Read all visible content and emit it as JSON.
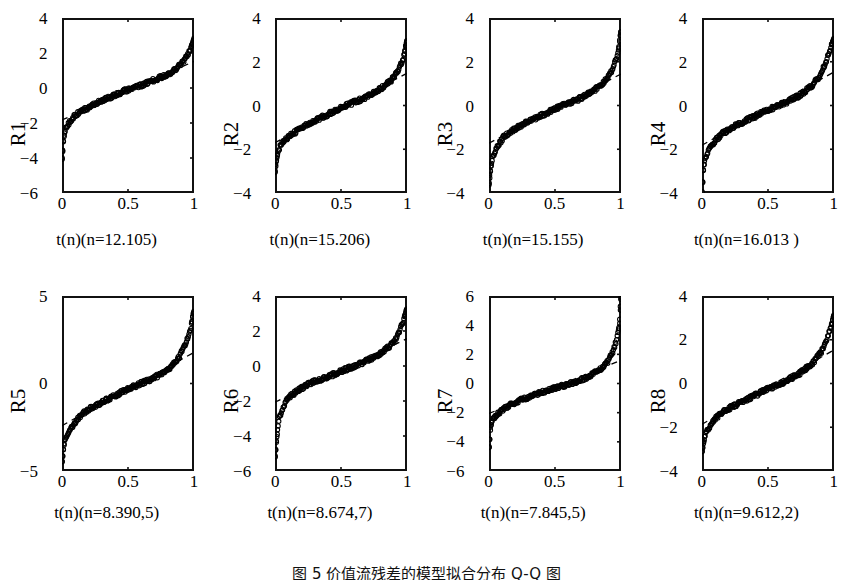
{
  "figure": {
    "caption": "图 5   价值流残差的模型拟合分布 Q-Q 图",
    "rows": 2,
    "cols": 4
  },
  "chart_data": {
    "type": "scatter",
    "title": "图 5   价值流残差的模型拟合分布 Q-Q 图",
    "layout": {
      "rows": 2,
      "cols": 4,
      "grid": false,
      "legend": "none"
    },
    "shared": {
      "xlabel_pattern": "t(n)(n=VALUE)",
      "xlim": [
        0,
        1
      ],
      "xticks": [
        "0",
        "0.5",
        "1"
      ],
      "xtickvals": [
        0,
        0.5,
        1
      ],
      "marker": "open-circle",
      "reference_line": "dashed"
    },
    "panels": [
      {
        "id": "R1",
        "ylabel": "R1",
        "xlabel": "t(n)(n=12.105)",
        "n_value": "12.105",
        "ylim": [
          -6,
          4
        ],
        "yticks": [
          "4",
          "2",
          "0",
          "-2",
          "-4",
          "-6"
        ],
        "ytickvals": [
          4,
          2,
          0,
          -2,
          -4,
          -6
        ],
        "quantile_curve": [
          [
            0.0,
            -4.05
          ],
          [
            0.01,
            -2.95
          ],
          [
            0.02,
            -2.55
          ],
          [
            0.03,
            -2.3
          ],
          [
            0.05,
            -2.05
          ],
          [
            0.08,
            -1.7
          ],
          [
            0.12,
            -1.45
          ],
          [
            0.18,
            -1.2
          ],
          [
            0.25,
            -0.9
          ],
          [
            0.32,
            -0.65
          ],
          [
            0.4,
            -0.4
          ],
          [
            0.5,
            -0.1
          ],
          [
            0.6,
            0.15
          ],
          [
            0.68,
            0.4
          ],
          [
            0.76,
            0.65
          ],
          [
            0.84,
            0.95
          ],
          [
            0.9,
            1.35
          ],
          [
            0.94,
            1.75
          ],
          [
            0.97,
            2.2
          ],
          [
            0.99,
            2.55
          ],
          [
            1.0,
            2.75
          ]
        ]
      },
      {
        "id": "R2",
        "ylabel": "R2",
        "xlabel": "t(n)(n=15.206)",
        "n_value": "15.206",
        "ylim": [
          -4,
          4
        ],
        "yticks": [
          "4",
          "2",
          "0",
          "-2",
          "-4"
        ],
        "ytickvals": [
          4,
          2,
          0,
          -2,
          -4
        ],
        "quantile_curve": [
          [
            0.0,
            -3.0
          ],
          [
            0.01,
            -2.45
          ],
          [
            0.02,
            -2.15
          ],
          [
            0.04,
            -1.85
          ],
          [
            0.07,
            -1.6
          ],
          [
            0.12,
            -1.35
          ],
          [
            0.18,
            -1.1
          ],
          [
            0.25,
            -0.85
          ],
          [
            0.33,
            -0.6
          ],
          [
            0.42,
            -0.35
          ],
          [
            0.5,
            -0.1
          ],
          [
            0.58,
            0.1
          ],
          [
            0.66,
            0.3
          ],
          [
            0.74,
            0.55
          ],
          [
            0.82,
            0.85
          ],
          [
            0.88,
            1.15
          ],
          [
            0.93,
            1.55
          ],
          [
            0.96,
            1.95
          ],
          [
            0.98,
            2.35
          ],
          [
            1.0,
            2.95
          ]
        ]
      },
      {
        "id": "R3",
        "ylabel": "R3",
        "xlabel": "t(n)(n=15.155)",
        "n_value": "15.155",
        "ylim": [
          -4,
          4
        ],
        "yticks": [
          "4",
          "2",
          "0",
          "-2",
          "-4"
        ],
        "ytickvals": [
          4,
          2,
          0,
          -2,
          -4
        ],
        "quantile_curve": [
          [
            0.0,
            -3.55
          ],
          [
            0.01,
            -2.95
          ],
          [
            0.02,
            -2.55
          ],
          [
            0.04,
            -2.2
          ],
          [
            0.07,
            -1.8
          ],
          [
            0.11,
            -1.45
          ],
          [
            0.16,
            -1.2
          ],
          [
            0.23,
            -0.95
          ],
          [
            0.31,
            -0.7
          ],
          [
            0.4,
            -0.45
          ],
          [
            0.5,
            -0.15
          ],
          [
            0.6,
            0.1
          ],
          [
            0.68,
            0.3
          ],
          [
            0.76,
            0.55
          ],
          [
            0.83,
            0.85
          ],
          [
            0.89,
            1.2
          ],
          [
            0.93,
            1.6
          ],
          [
            0.96,
            2.05
          ],
          [
            0.98,
            2.45
          ],
          [
            1.0,
            3.35
          ]
        ]
      },
      {
        "id": "R4",
        "ylabel": "R4",
        "xlabel": "t(n)(n=16.013 )",
        "n_value": "16.013",
        "ylim": [
          -4,
          4
        ],
        "yticks": [
          "4",
          "2",
          "0",
          "-2",
          "-4"
        ],
        "ytickvals": [
          4,
          2,
          0,
          -2,
          -4
        ],
        "quantile_curve": [
          [
            0.0,
            -3.95
          ],
          [
            0.01,
            -2.85
          ],
          [
            0.02,
            -2.55
          ],
          [
            0.04,
            -2.2
          ],
          [
            0.07,
            -1.85
          ],
          [
            0.11,
            -1.55
          ],
          [
            0.16,
            -1.25
          ],
          [
            0.23,
            -1.0
          ],
          [
            0.31,
            -0.75
          ],
          [
            0.4,
            -0.5
          ],
          [
            0.5,
            -0.2
          ],
          [
            0.6,
            0.05
          ],
          [
            0.68,
            0.25
          ],
          [
            0.76,
            0.55
          ],
          [
            0.84,
            0.95
          ],
          [
            0.89,
            1.35
          ],
          [
            0.93,
            1.85
          ],
          [
            0.96,
            2.35
          ],
          [
            0.98,
            2.7
          ],
          [
            1.0,
            3.05
          ]
        ]
      },
      {
        "id": "R5",
        "ylabel": "R5",
        "xlabel": "t(n)(n=8.390,5)",
        "n_value": "8.390,5",
        "ylim": [
          -5,
          5
        ],
        "yticks": [
          "5",
          "0",
          "-5"
        ],
        "ytickvals": [
          5,
          0,
          -5
        ],
        "quantile_curve": [
          [
            0.0,
            -4.45
          ],
          [
            0.01,
            -3.7
          ],
          [
            0.02,
            -3.3
          ],
          [
            0.04,
            -3.0
          ],
          [
            0.07,
            -2.55
          ],
          [
            0.11,
            -2.1
          ],
          [
            0.16,
            -1.7
          ],
          [
            0.23,
            -1.35
          ],
          [
            0.31,
            -1.05
          ],
          [
            0.4,
            -0.7
          ],
          [
            0.5,
            -0.3
          ],
          [
            0.6,
            0.0
          ],
          [
            0.68,
            0.25
          ],
          [
            0.76,
            0.6
          ],
          [
            0.84,
            1.05
          ],
          [
            0.89,
            1.55
          ],
          [
            0.93,
            2.15
          ],
          [
            0.96,
            2.8
          ],
          [
            0.98,
            3.35
          ],
          [
            1.0,
            4.1
          ]
        ]
      },
      {
        "id": "R6",
        "ylabel": "R6",
        "xlabel": "t(n)(n=8.674,7)",
        "n_value": "8.674,7",
        "ylim": [
          -6,
          4
        ],
        "yticks": [
          "4",
          "2",
          "0",
          "-2",
          "-4",
          "-6"
        ],
        "ytickvals": [
          4,
          2,
          0,
          -2,
          -4,
          -6
        ],
        "quantile_curve": [
          [
            0.0,
            -5.15
          ],
          [
            0.01,
            -4.25
          ],
          [
            0.02,
            -3.55
          ],
          [
            0.03,
            -3.05
          ],
          [
            0.05,
            -2.55
          ],
          [
            0.08,
            -2.05
          ],
          [
            0.12,
            -1.7
          ],
          [
            0.18,
            -1.35
          ],
          [
            0.25,
            -1.05
          ],
          [
            0.33,
            -0.8
          ],
          [
            0.42,
            -0.55
          ],
          [
            0.5,
            -0.3
          ],
          [
            0.6,
            0.0
          ],
          [
            0.68,
            0.25
          ],
          [
            0.76,
            0.55
          ],
          [
            0.84,
            0.95
          ],
          [
            0.9,
            1.35
          ],
          [
            0.94,
            1.95
          ],
          [
            0.97,
            2.55
          ],
          [
            1.0,
            3.25
          ]
        ]
      },
      {
        "id": "R7",
        "ylabel": "R7",
        "xlabel": "t(n)(n=7.845,5)",
        "n_value": "7.845,5",
        "ylim": [
          -6,
          6
        ],
        "yticks": [
          "6",
          "4",
          "2",
          "0",
          "-2",
          "-4",
          "-6"
        ],
        "ytickvals": [
          6,
          4,
          2,
          0,
          -2,
          -4,
          -6
        ],
        "quantile_curve": [
          [
            0.0,
            -4.35
          ],
          [
            0.01,
            -3.05
          ],
          [
            0.02,
            -2.65
          ],
          [
            0.04,
            -2.35
          ],
          [
            0.07,
            -2.05
          ],
          [
            0.11,
            -1.75
          ],
          [
            0.16,
            -1.45
          ],
          [
            0.23,
            -1.15
          ],
          [
            0.31,
            -0.9
          ],
          [
            0.4,
            -0.6
          ],
          [
            0.5,
            -0.3
          ],
          [
            0.6,
            -0.05
          ],
          [
            0.68,
            0.2
          ],
          [
            0.76,
            0.5
          ],
          [
            0.84,
            0.95
          ],
          [
            0.9,
            1.5
          ],
          [
            0.94,
            2.2
          ],
          [
            0.97,
            3.1
          ],
          [
            0.99,
            4.05
          ],
          [
            1.0,
            5.8
          ]
        ]
      },
      {
        "id": "R8",
        "ylabel": "R8",
        "xlabel": "t(n)(n=9.612,2)",
        "n_value": "9.612,2",
        "ylim": [
          -4,
          4
        ],
        "yticks": [
          "4",
          "2",
          "0",
          "-2",
          "-4"
        ],
        "ytickvals": [
          4,
          2,
          0,
          -2,
          -4
        ],
        "quantile_curve": [
          [
            0.0,
            -3.1
          ],
          [
            0.01,
            -2.7
          ],
          [
            0.02,
            -2.45
          ],
          [
            0.04,
            -2.15
          ],
          [
            0.07,
            -1.85
          ],
          [
            0.11,
            -1.55
          ],
          [
            0.16,
            -1.3
          ],
          [
            0.23,
            -1.05
          ],
          [
            0.31,
            -0.8
          ],
          [
            0.4,
            -0.55
          ],
          [
            0.5,
            -0.25
          ],
          [
            0.6,
            0.0
          ],
          [
            0.68,
            0.25
          ],
          [
            0.76,
            0.55
          ],
          [
            0.84,
            0.95
          ],
          [
            0.9,
            1.4
          ],
          [
            0.94,
            1.9
          ],
          [
            0.97,
            2.45
          ],
          [
            0.99,
            2.85
          ],
          [
            1.0,
            3.1
          ]
        ]
      }
    ]
  }
}
